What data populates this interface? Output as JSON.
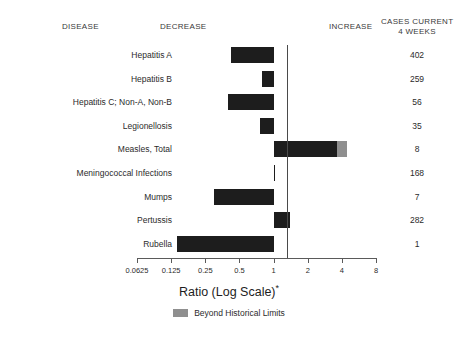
{
  "headers": {
    "disease": "DISEASE",
    "decrease": "DECREASE",
    "increase": "INCREASE",
    "cases_line1": "CASES CURRENT",
    "cases_line2": "4 WEEKS"
  },
  "axis_title": "Ratio (Log Scale)",
  "axis_title_marker": "*",
  "legend": {
    "swatch_color": "#8f8f8f",
    "label": "Beyond Historical Limits"
  },
  "colors": {
    "bar": "#1d1d1d",
    "excess": "#8f8f8f",
    "axis": "#5a5a5a",
    "background": "#ffffff"
  },
  "chart_data": {
    "type": "bar",
    "orientation": "horizontal",
    "title": "",
    "xlabel": "Ratio (Log Scale)*",
    "ylabel": "",
    "xscale": "log2",
    "xlim": [
      0.0625,
      8
    ],
    "xticks": [
      0.0625,
      0.125,
      0.25,
      0.5,
      1,
      2,
      4,
      8
    ],
    "xtick_labels": [
      "0.0625",
      "0.125",
      "0.25",
      "0.5",
      "1",
      "2",
      "4",
      "8"
    ],
    "grid": false,
    "baseline": 1,
    "legend_position": "bottom-center",
    "categories": [
      "Hepatitis A",
      "Hepatitis B",
      "Hepatitis C; Non-A, Non-B",
      "Legionellosis",
      "Measles, Total",
      "Meningococcal Infections",
      "Mumps",
      "Pertussis",
      "Rubella"
    ],
    "values": [
      0.42,
      0.79,
      0.4,
      0.76,
      4.4,
      1.0,
      0.3,
      1.4,
      0.14
    ],
    "beyond_historical_limits": [
      false,
      false,
      false,
      false,
      true,
      false,
      false,
      false,
      false
    ],
    "excess_threshold": [
      null,
      null,
      null,
      null,
      3.6,
      null,
      null,
      null,
      null
    ],
    "cases_current_4_weeks": [
      402,
      259,
      56,
      35,
      8,
      168,
      7,
      282,
      1
    ]
  }
}
